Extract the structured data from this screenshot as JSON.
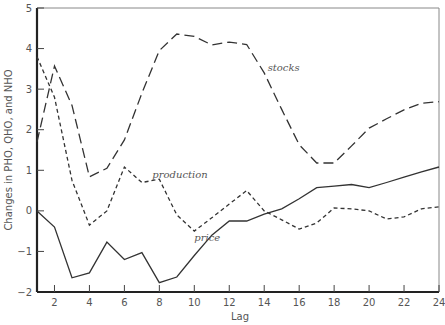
{
  "chart_data": {
    "type": "line",
    "title": "",
    "xlabel": "Lag",
    "ylabel": "Changes in PHO, QHO, and NHO",
    "xlim": [
      1,
      24
    ],
    "ylim": [
      -2,
      5
    ],
    "x_ticks": [
      2,
      4,
      6,
      8,
      10,
      12,
      14,
      16,
      18,
      20,
      22,
      24
    ],
    "y_ticks": [
      -2,
      -1,
      0,
      1,
      2,
      3,
      4,
      5
    ],
    "grid": false,
    "legend": "inline labels",
    "x": [
      1,
      2,
      3,
      4,
      5,
      6,
      7,
      8,
      9,
      10,
      11,
      12,
      13,
      14,
      15,
      16,
      17,
      18,
      19,
      20,
      21,
      22,
      23,
      24
    ],
    "series": [
      {
        "name": "stocks",
        "style": "long-dash",
        "label_pos": [
          14.2,
          3.45
        ],
        "values": [
          1.7,
          3.57,
          2.6,
          0.84,
          1.05,
          1.75,
          2.9,
          3.95,
          4.36,
          4.3,
          4.09,
          4.16,
          4.1,
          3.4,
          2.5,
          1.63,
          1.18,
          1.18,
          1.6,
          2.04,
          2.27,
          2.49,
          2.65,
          2.69
        ]
      },
      {
        "name": "production",
        "style": "short-dash",
        "label_pos": [
          7.6,
          0.8
        ],
        "values": [
          3.8,
          2.8,
          0.75,
          -0.35,
          0.0,
          1.08,
          0.7,
          0.78,
          -0.1,
          -0.5,
          -0.17,
          0.17,
          0.5,
          0.0,
          -0.22,
          -0.45,
          -0.3,
          0.07,
          0.05,
          0.0,
          -0.2,
          -0.15,
          0.05,
          0.1
        ]
      },
      {
        "name": "price",
        "style": "solid",
        "label_pos": [
          10.0,
          -0.75
        ],
        "values": [
          0.0,
          -0.4,
          -1.65,
          -1.53,
          -0.77,
          -1.2,
          -1.03,
          -1.77,
          -1.63,
          -1.1,
          -0.6,
          -0.25,
          -0.25,
          -0.08,
          0.05,
          0.3,
          0.57,
          0.61,
          0.65,
          0.57,
          0.7,
          0.83,
          0.96,
          1.08
        ]
      }
    ]
  }
}
